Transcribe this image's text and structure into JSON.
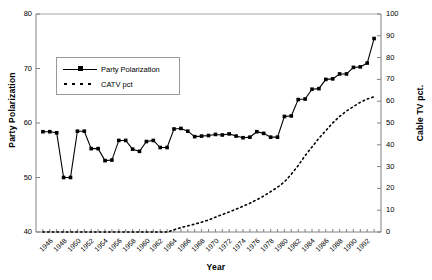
{
  "chart_data": {
    "type": "line",
    "title": "",
    "xlabel": "Year",
    "ylabel": "Party Polarization",
    "y2label": "Cable TV pct.",
    "xlim": [
      1945,
      1995
    ],
    "ylim": [
      40,
      80
    ],
    "y2lim": [
      0,
      100
    ],
    "grid": false,
    "legend_position": "upper-left-inside",
    "y_ticks": [
      40,
      50,
      60,
      70,
      80
    ],
    "y2_ticks": [
      0,
      10,
      20,
      30,
      40,
      50,
      60,
      70,
      80,
      90,
      100
    ],
    "x_tick_labels": [
      "1946",
      "1948",
      "1950",
      "1952",
      "1954",
      "1956",
      "1958",
      "1960",
      "1962",
      "1964",
      "1966",
      "1968",
      "1970",
      "1972",
      "1974",
      "1976",
      "1978",
      "1980",
      "1982",
      "1984",
      "1986",
      "1988",
      "1990",
      "1992"
    ],
    "x": [
      1946,
      1947,
      1948,
      1949,
      1950,
      1951,
      1952,
      1953,
      1954,
      1955,
      1956,
      1957,
      1958,
      1959,
      1960,
      1961,
      1962,
      1963,
      1964,
      1965,
      1966,
      1967,
      1968,
      1969,
      1970,
      1971,
      1972,
      1973,
      1974,
      1975,
      1976,
      1977,
      1978,
      1979,
      1980,
      1981,
      1982,
      1983,
      1984,
      1985,
      1986,
      1987,
      1988,
      1989,
      1990,
      1991,
      1992,
      1993,
      1994
    ],
    "series": [
      {
        "name": "Party Polarization",
        "axis": "left",
        "style": "solid-square",
        "values": [
          58.4,
          58.4,
          58.2,
          50.0,
          50.0,
          58.5,
          58.5,
          55.3,
          55.3,
          53.1,
          53.2,
          56.8,
          56.8,
          55.2,
          54.8,
          56.6,
          56.8,
          55.5,
          55.5,
          58.9,
          59.0,
          58.5,
          57.5,
          57.6,
          57.7,
          57.9,
          57.8,
          58.0,
          57.6,
          57.3,
          57.4,
          58.4,
          58.1,
          57.4,
          57.4,
          61.2,
          61.3,
          64.3,
          64.4,
          66.2,
          66.3,
          68.0,
          68.1,
          69.0,
          69.0,
          70.2,
          70.3,
          71.0,
          75.5
        ]
      },
      {
        "name": "CATV pct",
        "axis": "right",
        "style": "dotted",
        "values": [
          0,
          0,
          0,
          0,
          0,
          0,
          0,
          0,
          0,
          0,
          0,
          0,
          0,
          0,
          0,
          0,
          0,
          0,
          0,
          1.0,
          2.0,
          2.8,
          3.6,
          4.5,
          5.5,
          6.8,
          8.0,
          9.2,
          10.5,
          11.8,
          13.2,
          14.8,
          16.5,
          18.5,
          20.5,
          23.0,
          26.5,
          30.5,
          35.0,
          39.0,
          43.0,
          46.5,
          50.0,
          53.0,
          55.5,
          57.5,
          59.5,
          61.0,
          62.0
        ]
      }
    ]
  },
  "legend": {
    "entries": [
      {
        "label": "Party Polarization",
        "marker": "solid-line-square"
      },
      {
        "label": "CATV pct",
        "marker": "dotted-line"
      }
    ]
  },
  "colors": {
    "series_party": "#000000",
    "series_catv": "#000000",
    "axis": "#808080",
    "plot_border": "#a8a8a8",
    "background": "#ffffff"
  }
}
